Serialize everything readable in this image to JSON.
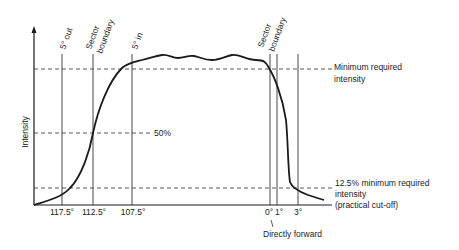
{
  "diagram": {
    "y_axis_label": "Intensity",
    "x_tick_labels": [
      "117.5°",
      "112.5°",
      "107.5°",
      "0°",
      "1°",
      "3°"
    ],
    "vertical_line_labels": {
      "five_out": "5° out",
      "sector_boundary_left_1": "Sector",
      "sector_boundary_left_2": "boundary",
      "five_in": "5° in",
      "sector_boundary_right_1": "Sector",
      "sector_boundary_right_2": "boundary"
    },
    "reference_lines": {
      "minimum_1": "Minimum required",
      "minimum_2": "intensity",
      "fifty": "50%",
      "cutoff_1": "12.5% minimum required",
      "cutoff_2": "intensity",
      "cutoff_3": "(practical cut-off)"
    },
    "annotation": "Directly forward",
    "colors": {
      "line": "#1a1a1a",
      "thin_line": "#333333",
      "dashed": "#444444",
      "background": "#ffffff"
    }
  }
}
